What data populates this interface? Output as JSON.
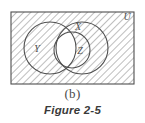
{
  "figure": {
    "subfigure_label": "(b)",
    "caption": "Figure 2-5",
    "type": "venn-diagram",
    "shading_description": "diagonal-hatch",
    "colors": {
      "hatch_line": "#9a9a9a",
      "outline": "#4f4f4f",
      "background": "#ffffff",
      "unshaded_region": "#ffffff",
      "label_text": "#4f4f4f",
      "caption_text": "#3a3a3a"
    },
    "universe": {
      "label": "U",
      "label_x": 127,
      "label_y": 20,
      "rect": {
        "x": 11,
        "y": 12,
        "width": 123,
        "height": 72
      }
    },
    "sets": [
      {
        "name": "Y",
        "label": "Y",
        "label_x": 37,
        "label_y": 52,
        "cx": 50,
        "cy": 48,
        "r": 26
      },
      {
        "name": "X",
        "label": "X",
        "label_x": 78,
        "label_y": 30,
        "cx": 82,
        "cy": 48,
        "r": 26
      },
      {
        "name": "Z",
        "label": "Z",
        "label_x": 80,
        "label_y": 52,
        "cx": 72,
        "cy": 50,
        "r": 18
      }
    ]
  }
}
